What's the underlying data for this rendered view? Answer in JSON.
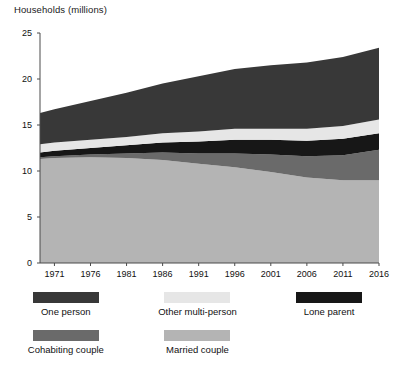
{
  "chart_data": {
    "type": "area",
    "stacked": true,
    "title": "",
    "ylabel": "Households (millions)",
    "xlabel": "",
    "ylim": [
      0,
      25
    ],
    "xlim": [
      1969,
      2016
    ],
    "yticks": [
      0,
      5,
      10,
      15,
      20,
      25
    ],
    "xticks": [
      1971,
      1976,
      1981,
      1986,
      1991,
      1996,
      2001,
      2006,
      2011,
      2016
    ],
    "grid": false,
    "legend_position": "below",
    "x": [
      1969,
      1971,
      1976,
      1981,
      1986,
      1991,
      1996,
      2001,
      2006,
      2011,
      2016
    ],
    "series": [
      {
        "name": "Married couple",
        "color": "#b4b4b4",
        "values": [
          11.3,
          11.4,
          11.5,
          11.4,
          11.2,
          10.8,
          10.4,
          9.9,
          9.3,
          9.0,
          9.0
        ]
      },
      {
        "name": "Cohabiting couple",
        "color": "#6a6a6a",
        "values": [
          0.2,
          0.2,
          0.3,
          0.5,
          0.8,
          1.1,
          1.5,
          1.9,
          2.3,
          2.7,
          3.3
        ]
      },
      {
        "name": "Lone parent",
        "color": "#171717",
        "values": [
          0.5,
          0.6,
          0.7,
          0.9,
          1.1,
          1.3,
          1.5,
          1.6,
          1.7,
          1.8,
          1.8
        ]
      },
      {
        "name": "Other multi-person",
        "color": "#e6e6e6",
        "values": [
          0.9,
          0.9,
          0.9,
          0.9,
          1.0,
          1.1,
          1.2,
          1.2,
          1.3,
          1.4,
          1.5
        ]
      },
      {
        "name": "One person",
        "color": "#383838",
        "values": [
          3.4,
          3.6,
          4.2,
          4.8,
          5.4,
          6.0,
          6.5,
          6.9,
          7.2,
          7.5,
          7.8
        ]
      }
    ],
    "totals": [
      16.3,
      16.7,
      17.6,
      18.5,
      19.5,
      20.3,
      21.1,
      21.5,
      21.8,
      22.4,
      23.4
    ]
  },
  "axis": {
    "y_title": "Households (millions)",
    "y_labels": [
      "25",
      "20",
      "15",
      "10",
      "5",
      "0"
    ],
    "x_labels": [
      "1971",
      "1976",
      "1981",
      "1986",
      "1991",
      "1996",
      "2001",
      "2006",
      "2011",
      "2016"
    ]
  },
  "legend": {
    "row1": [
      {
        "label": "One person",
        "color": "#383838"
      },
      {
        "label": "Other multi-person",
        "color": "#e6e6e6"
      },
      {
        "label": "Lone parent",
        "color": "#171717"
      }
    ],
    "row2": [
      {
        "label": "Cohabiting couple",
        "color": "#6a6a6a"
      },
      {
        "label": "Married couple",
        "color": "#b4b4b4"
      }
    ]
  }
}
